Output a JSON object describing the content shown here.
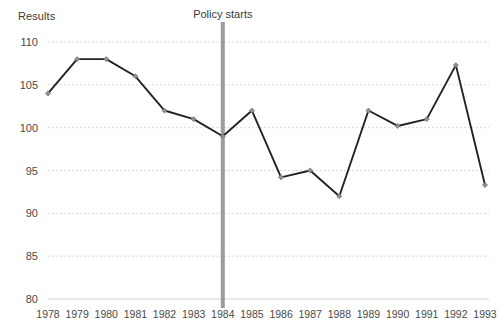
{
  "chart_data": {
    "type": "line",
    "title": "",
    "ylabel": "Results",
    "xlabel": "",
    "x": [
      1978,
      1979,
      1980,
      1981,
      1982,
      1983,
      1984,
      1985,
      1986,
      1987,
      1988,
      1989,
      1990,
      1991,
      1992,
      1993
    ],
    "categories": [
      "1978",
      "1979",
      "1980",
      "1981",
      "1982",
      "1983",
      "1984",
      "1985",
      "1986",
      "1987",
      "1988",
      "1989",
      "1990",
      "1991",
      "1992",
      "1993"
    ],
    "values": [
      104,
      108,
      108,
      106,
      102,
      101,
      99,
      102,
      94.2,
      95,
      92,
      102,
      100.2,
      101,
      107.3,
      93.3
    ],
    "series": [
      {
        "name": "Results",
        "values": [
          104,
          108,
          108,
          106,
          102,
          101,
          99,
          102,
          94.2,
          95,
          92,
          102,
          100.2,
          101,
          107.3,
          93.3
        ]
      }
    ],
    "ylim": [
      80,
      110
    ],
    "yticks": [
      80,
      85,
      90,
      95,
      100,
      105,
      110
    ],
    "ytick_labels": [
      "80",
      "85",
      "90",
      "95",
      "100",
      "105",
      "110"
    ],
    "xlim": [
      1978,
      1993
    ],
    "grid": "horizontal-dashed",
    "legend": "none",
    "annotations": [
      {
        "name": "policy-start-line",
        "label": "Policy starts",
        "x": 1984,
        "type": "vertical-line",
        "color": "#9c9c9c"
      }
    ],
    "line_color": "#222222",
    "marker_color": "#8f8f8f",
    "gridline_color": "#d9d9d9",
    "axis_color": "#d0d0d0",
    "background": "#ffffff"
  }
}
